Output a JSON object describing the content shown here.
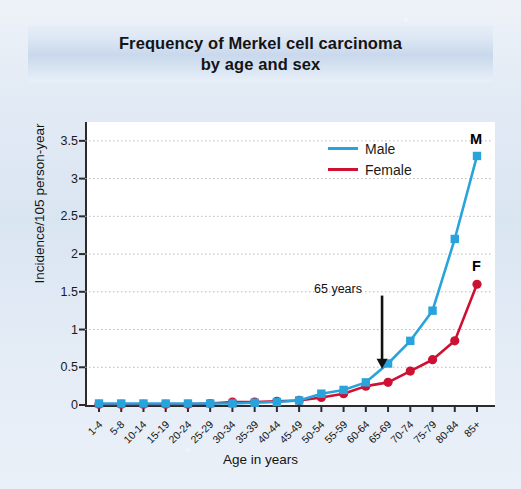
{
  "title": {
    "line1": "Frequency of Merkel cell carcinoma",
    "line2": "by age and sex"
  },
  "axes": {
    "ylabel": "Incidence/105 person-year",
    "xlabel": "Age in years"
  },
  "legend": {
    "male_label": "Male",
    "female_label": "Female"
  },
  "annotations": {
    "age65": "65 years",
    "male_end": "M",
    "female_end": "F"
  },
  "colors": {
    "male": "#29a3dc",
    "female": "#cc1133",
    "axis": "#2b2b2b",
    "grid": "#b9b9b9",
    "banner_top": "#e6edf7",
    "banner_mid": "#c9d8ec",
    "page_bg": "#dfe8f4",
    "plot_bg": "#ffffff",
    "text": "#141414"
  },
  "chart_data": {
    "type": "line",
    "title": "Frequency of Merkel cell carcinoma by age and sex",
    "xlabel": "Age in years",
    "ylabel": "Incidence/105 person-year",
    "categories": [
      "1-4",
      "5-8",
      "10-14",
      "15-19",
      "20-24",
      "25-29",
      "30-34",
      "35-39",
      "40-44",
      "45-49",
      "50-54",
      "55-59",
      "60-64",
      "65-69",
      "70-74",
      "75-79",
      "80-84",
      "85+"
    ],
    "yticks": [
      0,
      0.5,
      1,
      1.5,
      2,
      2.5,
      3,
      3.5
    ],
    "ytick_labels": [
      "0",
      "0.5",
      "1",
      "1.5",
      "2",
      "2.5",
      "3",
      "3.5"
    ],
    "ylim": [
      0,
      3.75
    ],
    "grid": "horizontal-dotted",
    "legend_position": "top-right-inside",
    "series": [
      {
        "name": "Male",
        "color": "#29a3dc",
        "marker": "square",
        "values": [
          0.02,
          0.02,
          0.02,
          0.02,
          0.02,
          0.02,
          0.02,
          0.03,
          0.04,
          0.06,
          0.15,
          0.2,
          0.3,
          0.55,
          0.85,
          1.25,
          2.2,
          3.3
        ]
      },
      {
        "name": "Female",
        "color": "#cc1133",
        "marker": "circle",
        "values": [
          0.01,
          0.01,
          0.01,
          0.01,
          0.01,
          0.02,
          0.04,
          0.04,
          0.05,
          0.06,
          0.1,
          0.15,
          0.25,
          0.3,
          0.45,
          0.6,
          0.85,
          1.6
        ]
      }
    ],
    "annotations": [
      {
        "text": "65 years",
        "points_to_category": "65-69",
        "style": "down-arrow"
      },
      {
        "text": "M",
        "at_category": "85+",
        "series": "Male"
      },
      {
        "text": "F",
        "at_category": "85+",
        "series": "Female"
      }
    ]
  }
}
